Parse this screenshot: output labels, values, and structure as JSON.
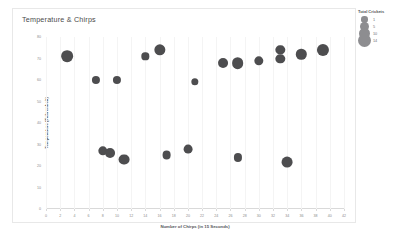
{
  "chart_data": {
    "type": "scatter",
    "title": "Temperature & Chirps",
    "xlabel": "Number of Chirps (in 15 Seconds)",
    "ylabel": "Temperature (Fahrenheit)",
    "xlim": [
      0,
      42
    ],
    "ylim": [
      0,
      80
    ],
    "xticks": [
      0,
      2,
      4,
      6,
      8,
      10,
      12,
      14,
      16,
      18,
      20,
      22,
      24,
      26,
      28,
      30,
      32,
      34,
      36,
      38,
      40,
      42
    ],
    "yticks": [
      0,
      10,
      20,
      30,
      40,
      50,
      60,
      70,
      80
    ],
    "grid": false,
    "legend_position": "right",
    "size_encoding": "Total Crickets",
    "point_color": "#4d4d4f",
    "points": [
      {
        "x": 3,
        "y": 71,
        "size": 10
      },
      {
        "x": 7,
        "y": 60,
        "size": 3
      },
      {
        "x": 10,
        "y": 60,
        "size": 3
      },
      {
        "x": 14,
        "y": 71,
        "size": 2
      },
      {
        "x": 16,
        "y": 74,
        "size": 9
      },
      {
        "x": 21,
        "y": 59,
        "size": 2
      },
      {
        "x": 25,
        "y": 68,
        "size": 6
      },
      {
        "x": 27,
        "y": 68,
        "size": 10
      },
      {
        "x": 30,
        "y": 69,
        "size": 5
      },
      {
        "x": 33,
        "y": 74,
        "size": 5
      },
      {
        "x": 33,
        "y": 70,
        "size": 5
      },
      {
        "x": 36,
        "y": 72,
        "size": 7
      },
      {
        "x": 39,
        "y": 74,
        "size": 11
      },
      {
        "x": 8,
        "y": 27,
        "size": 5
      },
      {
        "x": 9,
        "y": 26,
        "size": 6
      },
      {
        "x": 11,
        "y": 23,
        "size": 8
      },
      {
        "x": 17,
        "y": 25,
        "size": 4
      },
      {
        "x": 20,
        "y": 28,
        "size": 4
      },
      {
        "x": 27,
        "y": 24,
        "size": 3
      },
      {
        "x": 34,
        "y": 22,
        "size": 8
      }
    ],
    "legend": {
      "title": "Total Crickets",
      "entries": [
        {
          "label": "1",
          "size": 1
        },
        {
          "label": "5",
          "size": 5
        },
        {
          "label": "10",
          "size": 10
        },
        {
          "label": "14",
          "size": 14
        }
      ]
    }
  }
}
